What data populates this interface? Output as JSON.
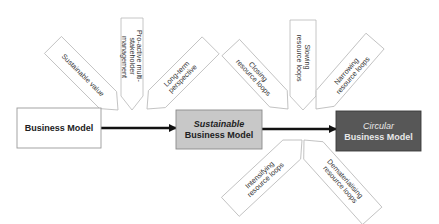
{
  "diagram": {
    "type": "flow-with-callouts",
    "nodes": [
      {
        "id": "bm",
        "label_lines": [
          "Business Model"
        ],
        "fill": "#ffffff",
        "text_color": "#222222",
        "border": "#9a9a9a"
      },
      {
        "id": "sbm",
        "label_lines": [
          "Sustainable",
          "Business Model"
        ],
        "italic_first_line": true,
        "fill": "#c8c8c8",
        "text_color": "#222222",
        "border": "#8a8a8a"
      },
      {
        "id": "cbm",
        "label_lines": [
          "Circular",
          "Business Model"
        ],
        "italic_first_line": true,
        "fill": "#575757",
        "text_color": "#e8e8e8",
        "border": "#3a3a3a"
      }
    ],
    "edges": [
      {
        "from": "bm",
        "to": "sbm"
      },
      {
        "from": "sbm",
        "to": "cbm"
      }
    ],
    "callouts_transition_1": [
      {
        "lines": [
          "Sustainable value"
        ]
      },
      {
        "lines": [
          "Pro-active multi-",
          "stakeholder",
          "management"
        ]
      },
      {
        "lines": [
          "Long-term",
          "perspective"
        ]
      }
    ],
    "callouts_transition_2_above": [
      {
        "lines": [
          "Closing",
          "resource loops"
        ]
      },
      {
        "lines": [
          "Slowing",
          "resource loops"
        ]
      },
      {
        "lines": [
          "Narrowing",
          "resource loops"
        ]
      }
    ],
    "callouts_transition_2_below": [
      {
        "lines": [
          "Intensifying",
          "resource loops"
        ]
      },
      {
        "lines": [
          "Dematerialising",
          "resource loops"
        ]
      }
    ]
  }
}
